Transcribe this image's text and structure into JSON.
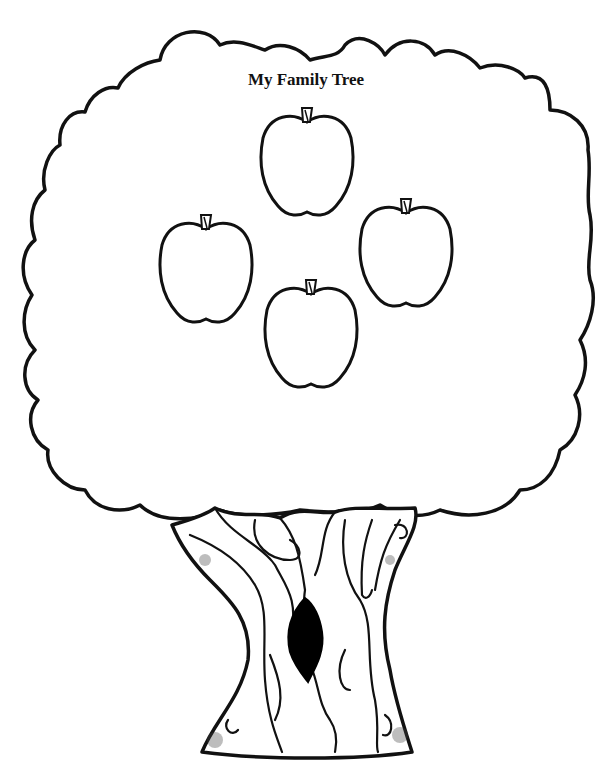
{
  "page": {
    "title": "My Family Tree",
    "colors": {
      "ink": "#111111",
      "paper": "#ffffff",
      "hollow": "#000000"
    }
  },
  "apples": [
    {
      "id": "top",
      "label": "",
      "x": 258,
      "y": 108,
      "w": 98,
      "h": 112
    },
    {
      "id": "left",
      "label": "",
      "x": 157,
      "y": 215,
      "w": 97,
      "h": 113
    },
    {
      "id": "right",
      "label": "",
      "x": 357,
      "y": 199,
      "w": 98,
      "h": 111
    },
    {
      "id": "bottom",
      "label": "",
      "x": 262,
      "y": 280,
      "w": 98,
      "h": 110
    }
  ]
}
